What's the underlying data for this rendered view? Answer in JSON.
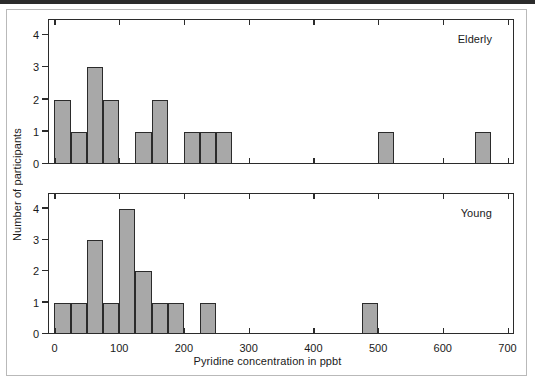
{
  "figure": {
    "xlabel": "Pyridine concentration in ppbt",
    "ylabel": "Number of participants",
    "background": "#ffffff",
    "bar_fill": "#a8a8a8",
    "bar_stroke": "#2b2b2b",
    "axis_color": "#2b2b2b"
  },
  "chart_data": [
    {
      "type": "bar",
      "title": "Elderly",
      "xlabel": "Pyridine concentration in ppbt",
      "ylabel": "Number of participants",
      "xlim": [
        -10,
        710
      ],
      "ylim": [
        0,
        4.5
      ],
      "xticks": [
        0,
        100,
        200,
        300,
        400,
        500,
        600,
        700
      ],
      "xticklabels": [
        "0",
        "100",
        "200",
        "300",
        "400",
        "500",
        "600",
        "700"
      ],
      "yticks": [
        0,
        1,
        2,
        3,
        4
      ],
      "yticklabels": [
        "0",
        "1",
        "2",
        "3",
        "4"
      ],
      "grid": false,
      "legend": "none",
      "bin_width": 25,
      "bins": [
        {
          "start": 0,
          "end": 25,
          "count": 2
        },
        {
          "start": 25,
          "end": 50,
          "count": 1
        },
        {
          "start": 50,
          "end": 75,
          "count": 3
        },
        {
          "start": 75,
          "end": 100,
          "count": 2
        },
        {
          "start": 100,
          "end": 125,
          "count": 0
        },
        {
          "start": 125,
          "end": 150,
          "count": 1
        },
        {
          "start": 150,
          "end": 175,
          "count": 2
        },
        {
          "start": 175,
          "end": 200,
          "count": 0
        },
        {
          "start": 200,
          "end": 225,
          "count": 1
        },
        {
          "start": 225,
          "end": 250,
          "count": 1
        },
        {
          "start": 250,
          "end": 275,
          "count": 1
        },
        {
          "start": 500,
          "end": 525,
          "count": 1
        },
        {
          "start": 650,
          "end": 675,
          "count": 1
        }
      ]
    },
    {
      "type": "bar",
      "title": "Young",
      "xlabel": "Pyridine concentration in ppbt",
      "ylabel": "Number of participants",
      "xlim": [
        -10,
        710
      ],
      "ylim": [
        0,
        4.5
      ],
      "xticks": [
        0,
        100,
        200,
        300,
        400,
        500,
        600,
        700
      ],
      "xticklabels": [
        "0",
        "100",
        "200",
        "300",
        "400",
        "500",
        "600",
        "700"
      ],
      "yticks": [
        0,
        1,
        2,
        3,
        4
      ],
      "yticklabels": [
        "0",
        "1",
        "2",
        "3",
        "4"
      ],
      "grid": false,
      "legend": "none",
      "bin_width": 25,
      "bins": [
        {
          "start": 0,
          "end": 25,
          "count": 1
        },
        {
          "start": 25,
          "end": 50,
          "count": 1
        },
        {
          "start": 50,
          "end": 75,
          "count": 3
        },
        {
          "start": 75,
          "end": 100,
          "count": 1
        },
        {
          "start": 100,
          "end": 125,
          "count": 4
        },
        {
          "start": 125,
          "end": 150,
          "count": 2
        },
        {
          "start": 150,
          "end": 175,
          "count": 1
        },
        {
          "start": 175,
          "end": 200,
          "count": 1
        },
        {
          "start": 200,
          "end": 225,
          "count": 0
        },
        {
          "start": 225,
          "end": 250,
          "count": 1
        },
        {
          "start": 475,
          "end": 500,
          "count": 1
        }
      ]
    }
  ]
}
